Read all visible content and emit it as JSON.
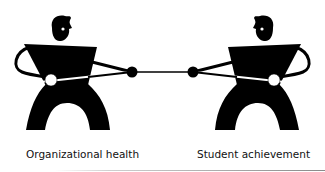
{
  "figures": {
    "left": {
      "label": "Organizational health"
    },
    "right": {
      "label": "Student achievement"
    }
  },
  "colors": {
    "figure": "#000000",
    "background": "#ffffff",
    "highlight": "#ffffff"
  }
}
